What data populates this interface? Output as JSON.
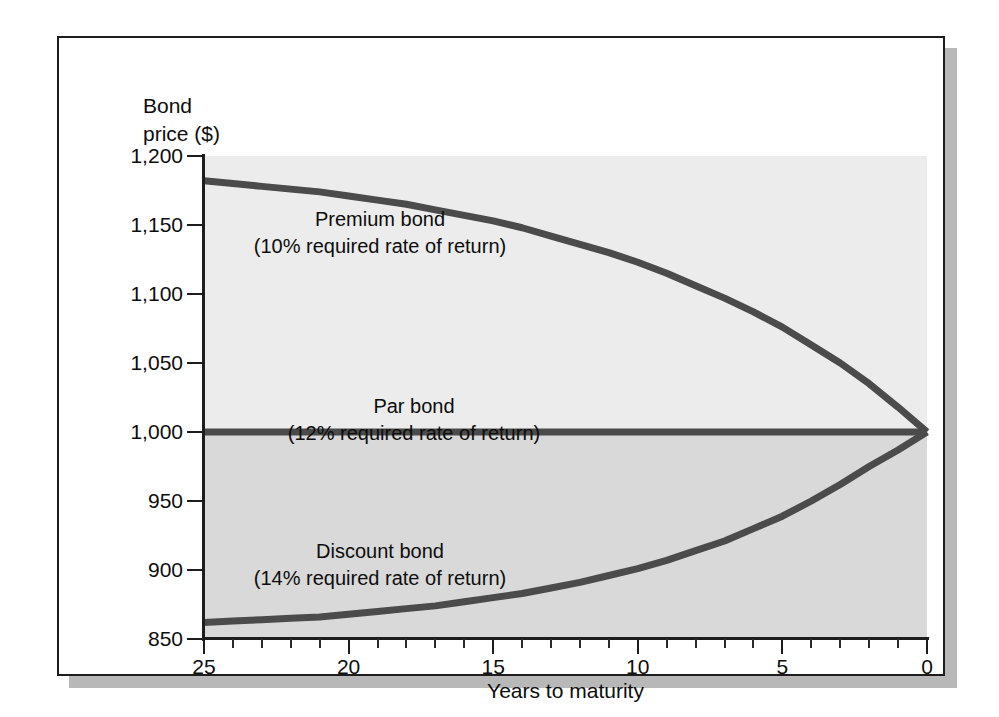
{
  "chart_data": {
    "type": "line",
    "title": "",
    "xlabel": "Years to maturity",
    "ylabel": "Bond\nprice ($)",
    "xlim": [
      25,
      0
    ],
    "ylim": [
      850,
      1200
    ],
    "x_reversed": true,
    "grid": false,
    "legend_position": "inline-annotations",
    "xticks": [
      "25",
      "20",
      "15",
      "10",
      "5",
      "0"
    ],
    "xtick_values": [
      25,
      20,
      15,
      10,
      5,
      0
    ],
    "xtick_minor_step": 1,
    "yticks": [
      "1,200",
      "1,150",
      "1,100",
      "1,050",
      "1,000",
      "950",
      "900",
      "850"
    ],
    "ytick_values": [
      1200,
      1150,
      1100,
      1050,
      1000,
      950,
      900,
      850
    ],
    "x": [
      25,
      24,
      23,
      22,
      21,
      20,
      19,
      18,
      17,
      16,
      15,
      14,
      13,
      12,
      11,
      10,
      9,
      8,
      7,
      6,
      5,
      4,
      3,
      2,
      1,
      0
    ],
    "series": [
      {
        "name": "Premium bond",
        "sublabel": "(10% required rate of return)",
        "rate_percent": 10,
        "color": "#4b4b4b",
        "values": [
          1182,
          1180,
          1178,
          1176,
          1174,
          1171,
          1168,
          1165,
          1161,
          1157,
          1153,
          1148,
          1142,
          1136,
          1130,
          1123,
          1115,
          1106,
          1097,
          1087,
          1076,
          1063,
          1050,
          1035,
          1018,
          1000
        ]
      },
      {
        "name": "Par bond",
        "sublabel": "(12% required rate of return)",
        "rate_percent": 12,
        "color": "#4b4b4b",
        "values": [
          1000,
          1000,
          1000,
          1000,
          1000,
          1000,
          1000,
          1000,
          1000,
          1000,
          1000,
          1000,
          1000,
          1000,
          1000,
          1000,
          1000,
          1000,
          1000,
          1000,
          1000,
          1000,
          1000,
          1000,
          1000,
          1000
        ]
      },
      {
        "name": "Discount bond",
        "sublabel": "(14% required rate of return)",
        "rate_percent": 14,
        "color": "#4b4b4b",
        "values": [
          862,
          863,
          864,
          865,
          866,
          868,
          870,
          872,
          874,
          877,
          880,
          883,
          887,
          891,
          896,
          901,
          907,
          914,
          921,
          930,
          939,
          950,
          962,
          975,
          987,
          1000
        ]
      }
    ],
    "annotations": [
      {
        "id": "premium",
        "line1": "Premium bond",
        "line2": "(10% required rate of return)"
      },
      {
        "id": "par",
        "line1": "Par bond",
        "line2": "(12% required rate of return)"
      },
      {
        "id": "discount",
        "line1": "Discount bond",
        "line2": "(14% required rate of return)"
      }
    ],
    "colors": {
      "curve": "#4b4b4b",
      "plot_band_upper": "#ececec",
      "plot_band_lower": "#d9d9d9",
      "axis": "#1d1d1d",
      "text": "#0d0d0d",
      "frame": "#1d1d1d",
      "shadow": "#b8b8b8",
      "page_background": "#ffffff"
    }
  }
}
